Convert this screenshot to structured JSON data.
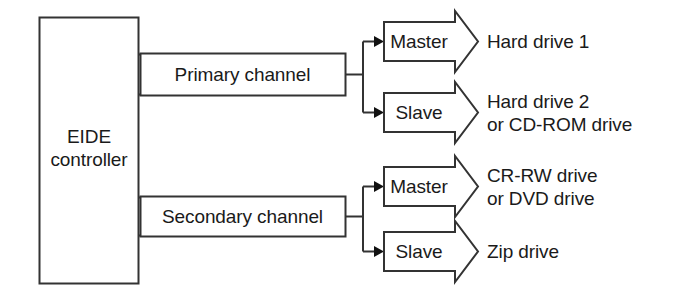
{
  "diagram": {
    "style": {
      "stroke_color": "#333333",
      "text_color": "#1a1a1a",
      "background": "#ffffff",
      "stroke_width": 2
    },
    "controller": {
      "label": "EIDE\ncontroller",
      "name": "eide-controller"
    },
    "channels": [
      {
        "label": "Primary channel",
        "name": "primary-channel"
      },
      {
        "label": "Secondary channel",
        "name": "secondary-channel"
      }
    ],
    "roles": {
      "master": "Master",
      "slave": "Slave"
    },
    "devices": [
      {
        "role": "Master",
        "channel": "Primary channel",
        "label": "Hard drive 1"
      },
      {
        "role": "Slave",
        "channel": "Primary channel",
        "label": "Hard drive 2\nor CD-ROM drive"
      },
      {
        "role": "Master",
        "channel": "Secondary channel",
        "label": "CR-RW drive\nor DVD drive"
      },
      {
        "role": "Slave",
        "channel": "Secondary channel",
        "label": "Zip drive"
      }
    ]
  }
}
